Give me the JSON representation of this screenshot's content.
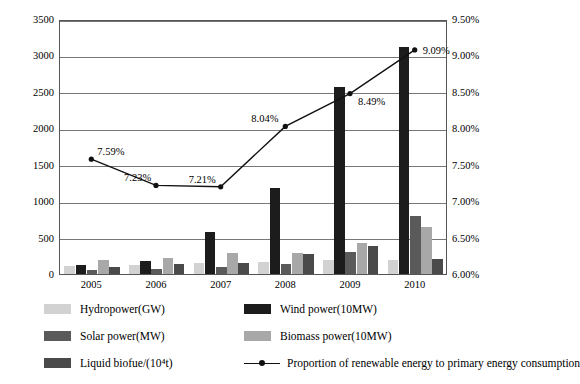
{
  "chart_data": {
    "type": "bar",
    "title": "",
    "subtitle": "",
    "xlabel": "",
    "ylabel": "",
    "categories": [
      "2005",
      "2006",
      "2007",
      "2008",
      "2009",
      "2010"
    ],
    "series": [
      {
        "name": "Hydropower(GW)",
        "color": "#d2d2d2",
        "values": [
          110,
          125,
          145,
          170,
          190,
          195
        ]
      },
      {
        "name": "Wind power(10MW)",
        "color": "#1c1c1c",
        "values": [
          130,
          180,
          580,
          1180,
          2570,
          3110
        ]
      },
      {
        "name": "Solar power(MW)",
        "color": "#5a5a5a",
        "values": [
          60,
          70,
          100,
          140,
          305,
          800
        ]
      },
      {
        "name": "Biomass power(10MW)",
        "color": "#a8a8a8",
        "values": [
          195,
          215,
          290,
          290,
          430,
          650
        ]
      },
      {
        "name": "Liquid biofue/(10⁴t)",
        "color": "#4a4a4a",
        "values": [
          100,
          140,
          145,
          270,
          390,
          200
        ]
      }
    ],
    "line_series": {
      "name": "Proportion of renewable energy to primary energy consumption",
      "color": "#111111",
      "labels": [
        "7.59%",
        "7.23%",
        "7.21%",
        "8.04%",
        "8.49%",
        "9.09%"
      ],
      "values": [
        7.59,
        7.23,
        7.21,
        8.04,
        8.49,
        9.09
      ]
    },
    "ylim": [
      0,
      3500
    ],
    "yticks": [
      "0",
      "500",
      "1000",
      "1500",
      "2000",
      "2500",
      "3000",
      "3500"
    ],
    "y2lim": [
      6.0,
      9.5
    ],
    "y2ticks": [
      "6.00%",
      "6.50%",
      "7.00%",
      "7.50%",
      "8.00%",
      "8.50%",
      "9.00%",
      "9.50%"
    ],
    "grid": true,
    "legend_position": "bottom"
  },
  "legend": {
    "items": [
      {
        "label": "Hydropower(GW)",
        "color": "#d2d2d2",
        "kind": "swatch"
      },
      {
        "label": "Wind power(10MW)",
        "color": "#1c1c1c",
        "kind": "swatch"
      },
      {
        "label": "Solar power(MW)",
        "color": "#5a5a5a",
        "kind": "swatch"
      },
      {
        "label": "Biomass power(10MW)",
        "color": "#a8a8a8",
        "kind": "swatch"
      },
      {
        "label": "Liquid biofue/(10⁴t)",
        "color": "#4a4a4a",
        "kind": "swatch"
      },
      {
        "label": "Proportion of renewable energy to primary energy consumption",
        "color": "#111111",
        "kind": "line"
      }
    ]
  }
}
